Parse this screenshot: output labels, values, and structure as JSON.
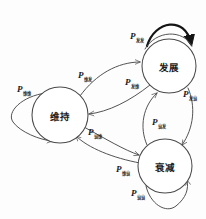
{
  "diagram": {
    "type": "state-transition-diagram",
    "title": "",
    "background_color": "#fdfdfd",
    "stroke_color": "#4a4a4a",
    "bold_stroke_color": "#141414",
    "nodes": [
      {
        "id": "weichi",
        "label": "维持",
        "cx": 60,
        "cy": 115,
        "r": 28
      },
      {
        "id": "fazhan",
        "label": "发展",
        "cx": 169,
        "cy": 66,
        "r": 27
      },
      {
        "id": "shuaijian",
        "label": "衰减",
        "cx": 165,
        "cy": 166,
        "r": 27
      }
    ],
    "edges": [
      {
        "id": "e-ww",
        "from": "weichi",
        "to": "weichi",
        "p": "P",
        "sub": "维维",
        "label_x": 17,
        "label_y": 92,
        "bold": false
      },
      {
        "id": "e-wf",
        "from": "weichi",
        "to": "fazhan",
        "p": "P",
        "sub": "维发",
        "label_x": 78,
        "label_y": 78,
        "bold": false
      },
      {
        "id": "e-fw",
        "from": "fazhan",
        "to": "weichi",
        "p": "P",
        "sub": "发维",
        "label_x": 125,
        "label_y": 85,
        "bold": false
      },
      {
        "id": "e-ff",
        "from": "fazhan",
        "to": "fazhan",
        "p": "P",
        "sub": "发发",
        "label_x": 130,
        "label_y": 39,
        "bold": true
      },
      {
        "id": "e-fs",
        "from": "fazhan",
        "to": "shuaijian",
        "p": "P",
        "sub": "发衰",
        "label_x": 183,
        "label_y": 97,
        "bold": false
      },
      {
        "id": "e-sf",
        "from": "shuaijian",
        "to": "fazhan",
        "p": "P",
        "sub": "衰发",
        "label_x": 152,
        "label_y": 125,
        "bold": false
      },
      {
        "id": "e-sw",
        "from": "shuaijian",
        "to": "weichi",
        "p": "P",
        "sub": "衰维",
        "label_x": 88,
        "label_y": 135,
        "bold": false
      },
      {
        "id": "e-ws",
        "from": "weichi",
        "to": "shuaijian",
        "p": "P",
        "sub": "维衰",
        "label_x": 116,
        "label_y": 172,
        "bold": false
      },
      {
        "id": "e-ss",
        "from": "shuaijian",
        "to": "shuaijian",
        "p": "P",
        "sub": "衰衰",
        "label_x": 131,
        "label_y": 196,
        "bold": false
      }
    ]
  }
}
